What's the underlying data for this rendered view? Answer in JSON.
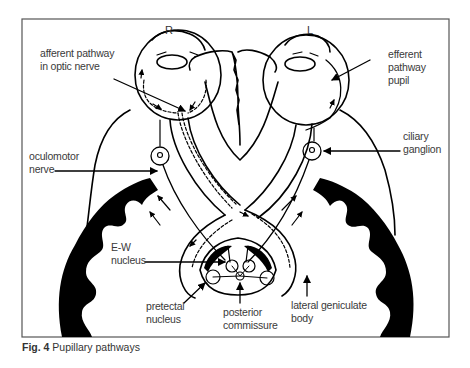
{
  "figure": {
    "caption_number": "Fig. 4",
    "caption_text": " Pupillary pathways",
    "sides": {
      "right_eye": "R",
      "left_eye": "L"
    },
    "labels": {
      "afferent_line1": "afferent pathway",
      "afferent_line2": "in optic nerve",
      "efferent_line1": "efferent",
      "efferent_line2": "pathway",
      "efferent_line3": "pupil",
      "oculomotor_line1": "oculomotor",
      "oculomotor_line2": "nerve",
      "ciliary_line1": "ciliary",
      "ciliary_line2": "ganglion",
      "ew_line1": "E-W",
      "ew_line2": "nucleus",
      "pretectal_line1": "pretectal",
      "pretectal_line2": "nucleus",
      "posterior_line1": "posterior",
      "posterior_line2": "commissure",
      "lgb_line1": "lateral geniculate",
      "lgb_line2": "body"
    },
    "colors": {
      "ink": "#000000",
      "frame": "#555555",
      "text": "#3a3a3a",
      "background": "#ffffff"
    }
  }
}
